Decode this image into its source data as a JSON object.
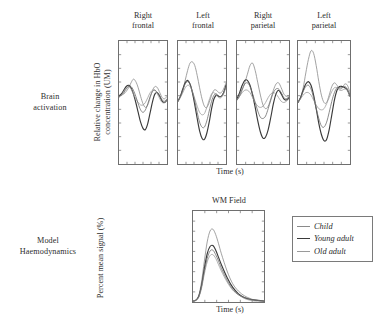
{
  "figure": {
    "rows": [
      {
        "id": "brain-activation",
        "label_line1": "Brain",
        "label_line2": "activation"
      },
      {
        "id": "model-haemodynamics",
        "label_line1": "Model",
        "label_line2": "Haemodynamics"
      }
    ]
  },
  "top_row": {
    "y_axis_label_line1": "Relative change in HbO",
    "y_axis_label_line2": "concentration (UM)",
    "x_axis_label": "Time (s)",
    "panels": [
      {
        "head_line1": "Right",
        "head_line2": "frontal"
      },
      {
        "head_line1": "Left",
        "head_line2": "frontal"
      },
      {
        "head_line1": "Right",
        "head_line2": "parietal"
      },
      {
        "head_line1": "Left",
        "head_line2": "parietal"
      }
    ]
  },
  "bottom_row": {
    "y_axis_label": "Percent mean signal (%)",
    "x_axis_label": "Time (s)",
    "panel_title": "WM Field"
  },
  "legend": {
    "items": [
      {
        "label": "Child",
        "color": "#8a8a8a"
      },
      {
        "label": "Young adult",
        "color": "#3a3a3a"
      },
      {
        "label": "Old adult",
        "color": "#9a9a9a"
      }
    ]
  },
  "colors": {
    "child": "#8a8a8a",
    "young_adult": "#3a3a3a",
    "old_adult": "#9a9a9a",
    "fourth": "#6d6d6d",
    "frame": "#6f6f6f",
    "text": "#2e2e2e"
  },
  "chart_data": [
    {
      "id": "right-frontal",
      "type": "line",
      "title": "Right frontal",
      "xlabel": "Time (s)",
      "ylabel": "Relative change in HbO concentration (UM)",
      "xlim": [
        0,
        100
      ],
      "ylim": [
        0,
        100
      ],
      "grid": false,
      "legend_position": "external-bottom-right",
      "x": [
        0,
        5,
        10,
        15,
        20,
        25,
        30,
        35,
        40,
        45,
        50,
        55,
        60,
        65,
        70,
        75,
        80,
        85,
        90,
        95,
        100
      ],
      "series": [
        {
          "name": "Child",
          "values": [
            56,
            56,
            57,
            59,
            62,
            66,
            69,
            67,
            62,
            55,
            49,
            46,
            48,
            54,
            60,
            63,
            62,
            58,
            54,
            53,
            55
          ]
        },
        {
          "name": "Young adult",
          "values": [
            55,
            57,
            60,
            63,
            64,
            62,
            57,
            50,
            42,
            34,
            29,
            28,
            33,
            42,
            51,
            57,
            58,
            55,
            51,
            50,
            52
          ]
        },
        {
          "name": "Old adult",
          "values": [
            54,
            56,
            59,
            62,
            63,
            61,
            57,
            53,
            50,
            48,
            48,
            50,
            54,
            58,
            60,
            60,
            57,
            53,
            50,
            50,
            52
          ]
        },
        {
          "name": "Fourth trace",
          "values": [
            55,
            56,
            58,
            61,
            63,
            63,
            60,
            55,
            49,
            44,
            42,
            44,
            49,
            55,
            59,
            60,
            58,
            55,
            52,
            51,
            53
          ]
        }
      ]
    },
    {
      "id": "left-frontal",
      "type": "line",
      "title": "Left frontal",
      "xlabel": "Time (s)",
      "ylabel": "Relative change in HbO concentration (UM)",
      "xlim": [
        0,
        100
      ],
      "ylim": [
        0,
        100
      ],
      "grid": false,
      "x": [
        0,
        5,
        10,
        15,
        20,
        25,
        30,
        35,
        40,
        45,
        50,
        55,
        60,
        65,
        70,
        75,
        80,
        85,
        90,
        95,
        100
      ],
      "series": [
        {
          "name": "Child",
          "values": [
            52,
            55,
            60,
            68,
            76,
            82,
            83,
            80,
            72,
            62,
            53,
            47,
            46,
            50,
            56,
            60,
            60,
            58,
            58,
            61,
            66
          ]
        },
        {
          "name": "Young adult",
          "values": [
            51,
            55,
            61,
            66,
            68,
            65,
            58,
            48,
            37,
            27,
            21,
            20,
            25,
            34,
            45,
            53,
            56,
            55,
            55,
            58,
            64
          ]
        },
        {
          "name": "Old adult",
          "values": [
            51,
            54,
            58,
            62,
            64,
            63,
            59,
            53,
            47,
            42,
            40,
            41,
            46,
            52,
            57,
            58,
            56,
            54,
            54,
            57,
            62
          ]
        },
        {
          "name": "Fourth trace",
          "values": [
            51,
            55,
            60,
            65,
            67,
            65,
            59,
            51,
            42,
            34,
            30,
            30,
            35,
            43,
            51,
            56,
            57,
            55,
            55,
            58,
            63
          ]
        }
      ]
    },
    {
      "id": "right-parietal",
      "type": "line",
      "title": "Right parietal",
      "xlabel": "Time (s)",
      "ylabel": "Relative change in HbO concentration (UM)",
      "xlim": [
        0,
        100
      ],
      "ylim": [
        0,
        100
      ],
      "grid": false,
      "x": [
        0,
        5,
        10,
        15,
        20,
        25,
        30,
        35,
        40,
        45,
        50,
        55,
        60,
        65,
        70,
        75,
        80,
        85,
        90,
        95,
        100
      ],
      "series": [
        {
          "name": "Child",
          "values": [
            52,
            55,
            60,
            66,
            73,
            80,
            82,
            76,
            66,
            56,
            48,
            45,
            47,
            53,
            60,
            65,
            66,
            62,
            57,
            55,
            56
          ]
        },
        {
          "name": "Young adult",
          "values": [
            53,
            58,
            64,
            68,
            68,
            64,
            56,
            46,
            35,
            26,
            21,
            22,
            28,
            38,
            49,
            57,
            60,
            57,
            53,
            52,
            54
          ]
        },
        {
          "name": "Old adult",
          "values": [
            52,
            55,
            58,
            60,
            60,
            58,
            54,
            50,
            47,
            46,
            47,
            50,
            54,
            57,
            58,
            57,
            54,
            51,
            50,
            51,
            53
          ]
        },
        {
          "name": "Fourth trace",
          "values": [
            52,
            56,
            61,
            65,
            66,
            63,
            57,
            50,
            43,
            38,
            37,
            39,
            45,
            52,
            58,
            61,
            61,
            58,
            54,
            53,
            55
          ]
        }
      ]
    },
    {
      "id": "left-parietal",
      "type": "line",
      "title": "Left parietal",
      "xlabel": "Time (s)",
      "ylabel": "Relative change in HbO concentration (UM)",
      "xlim": [
        0,
        100
      ],
      "ylim": [
        0,
        100
      ],
      "grid": false,
      "x": [
        0,
        5,
        10,
        15,
        20,
        25,
        30,
        35,
        40,
        45,
        50,
        55,
        60,
        65,
        70,
        75,
        80,
        85,
        90,
        95,
        100
      ],
      "series": [
        {
          "name": "Child",
          "values": [
            50,
            54,
            62,
            74,
            85,
            92,
            90,
            80,
            67,
            56,
            50,
            50,
            56,
            63,
            66,
            64,
            61,
            62,
            65,
            64,
            58
          ]
        },
        {
          "name": "Young adult",
          "values": [
            50,
            54,
            60,
            65,
            67,
            64,
            56,
            45,
            33,
            24,
            19,
            20,
            28,
            40,
            52,
            60,
            63,
            63,
            62,
            60,
            55
          ]
        },
        {
          "name": "Old adult",
          "values": [
            50,
            53,
            56,
            58,
            58,
            56,
            52,
            48,
            45,
            44,
            45,
            49,
            54,
            59,
            62,
            62,
            60,
            60,
            61,
            60,
            55
          ]
        },
        {
          "name": "Fourth trace",
          "values": [
            50,
            54,
            59,
            63,
            64,
            61,
            54,
            45,
            37,
            31,
            30,
            34,
            42,
            51,
            58,
            62,
            62,
            62,
            63,
            61,
            56
          ]
        }
      ]
    },
    {
      "id": "wm-field",
      "type": "line",
      "title": "WM Field",
      "xlabel": "Time (s)",
      "ylabel": "Percent mean signal (%)",
      "xlim": [
        0,
        100
      ],
      "ylim": [
        0,
        100
      ],
      "grid": false,
      "x": [
        0,
        4,
        8,
        12,
        16,
        20,
        24,
        28,
        32,
        36,
        40,
        48,
        56,
        64,
        72,
        80,
        88,
        100
      ],
      "series": [
        {
          "name": "Child",
          "values": [
            1,
            2,
            7,
            22,
            45,
            66,
            78,
            80,
            74,
            64,
            53,
            34,
            20,
            12,
            7,
            4,
            2,
            1
          ]
        },
        {
          "name": "Young adult",
          "values": [
            1,
            2,
            6,
            18,
            37,
            53,
            61,
            62,
            57,
            49,
            41,
            27,
            16,
            9,
            5,
            3,
            2,
            1
          ]
        },
        {
          "name": "Old adult",
          "values": [
            1,
            2,
            5,
            15,
            31,
            44,
            51,
            52,
            48,
            41,
            34,
            22,
            13,
            8,
            4,
            2,
            1,
            1
          ]
        },
        {
          "name": "Fourth trace",
          "values": [
            1,
            2,
            6,
            17,
            34,
            48,
            56,
            57,
            52,
            45,
            37,
            24,
            14,
            8,
            5,
            3,
            2,
            1
          ]
        }
      ]
    }
  ]
}
